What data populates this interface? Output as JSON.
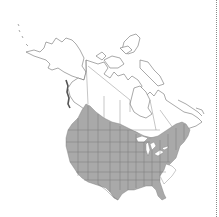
{
  "map": {
    "title": "North America distribution map",
    "region": "North America (Canada, United States)",
    "legend": [],
    "colors": {
      "background": "#ffffff",
      "range_fill": "#a9a9a9",
      "border_line": "#6e6e6e",
      "range_border_line": "#7a7a7a",
      "divider": "#8a8a8a"
    },
    "range_description": "Shaded range covers most of the contiguous United States (excluding coastal Carolinas/Georgia) and southern Canada from British Columbia east to the Maritimes"
  }
}
